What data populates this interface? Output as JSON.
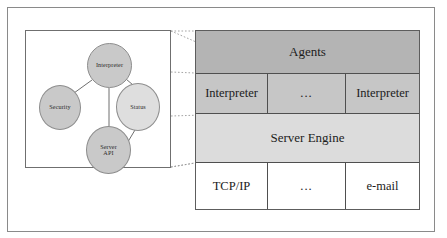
{
  "detail_box": {
    "name": "interpreter-detail",
    "nodes": [
      {
        "id": "interpreter",
        "label": "Interpreter",
        "shade": "dark"
      },
      {
        "id": "security",
        "label": "Security",
        "shade": "dark"
      },
      {
        "id": "status",
        "label": "Status",
        "shade": "light"
      },
      {
        "id": "server_api",
        "label_line1": "Server",
        "label_line2": "API",
        "shade": "dark"
      }
    ],
    "edges": [
      {
        "from": "interpreter",
        "to": "security"
      },
      {
        "from": "interpreter",
        "to": "status"
      },
      {
        "from": "interpreter",
        "to": "server_api"
      },
      {
        "from": "status",
        "to": "server_api"
      }
    ]
  },
  "stack": {
    "layers": [
      {
        "id": "agents",
        "label": "Agents",
        "kind": "band",
        "color": "#b4b4b4"
      },
      {
        "id": "interpreters",
        "kind": "cells",
        "color": "#c6c6c6",
        "cells": [
          "Interpreter",
          "...",
          "Interpreter"
        ]
      },
      {
        "id": "server_engine",
        "label": "Server Engine",
        "kind": "band",
        "color": "#dcdcdc"
      },
      {
        "id": "transport",
        "kind": "cells",
        "color": "#ffffff",
        "cells": [
          "TCP/IP",
          "...",
          "e-mail"
        ]
      }
    ]
  },
  "colors": {
    "frame": "#8a8a8a",
    "box_border": "#6f6f6f",
    "cell_border": "#4f4f4f",
    "node_dark": "#c9c9c9",
    "node_light": "#dedede",
    "connector": "#9a9a9a",
    "text": "#1c1c1c",
    "background": "#ffffff"
  }
}
